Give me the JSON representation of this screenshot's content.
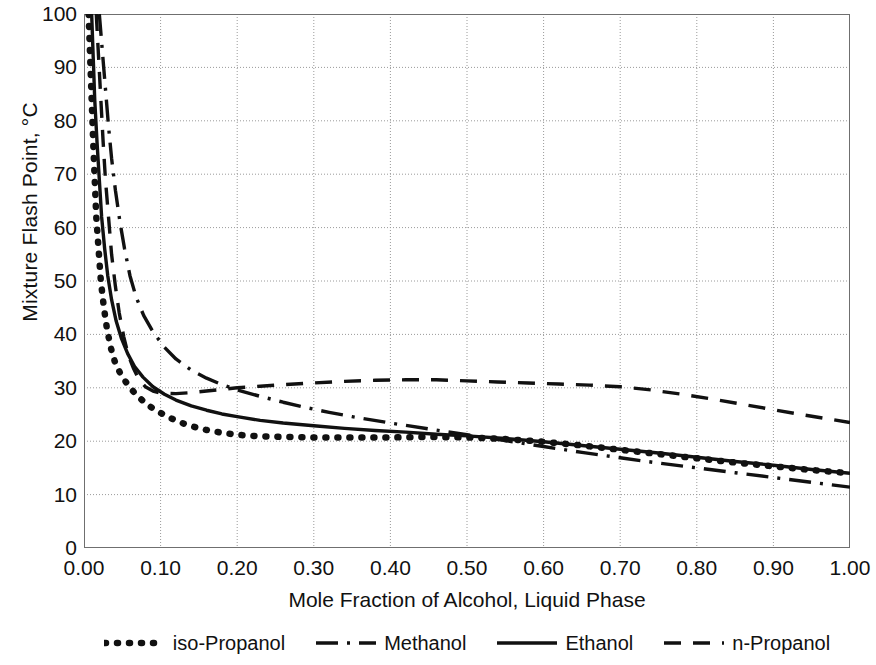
{
  "chart_data": {
    "type": "line",
    "title": "",
    "xlabel": "Mole Fraction of Alcohol, Liquid Phase",
    "ylabel": "Mixture Flash Point, °C",
    "xlim": [
      0.0,
      1.0
    ],
    "ylim": [
      0,
      100
    ],
    "xticks": [
      "0.00",
      "0.10",
      "0.20",
      "0.30",
      "0.40",
      "0.50",
      "0.60",
      "0.70",
      "0.80",
      "0.90",
      "1.00"
    ],
    "xtick_values": [
      0.0,
      0.1,
      0.2,
      0.3,
      0.4,
      0.5,
      0.6,
      0.7,
      0.8,
      0.9,
      1.0
    ],
    "yticks": [
      "0",
      "10",
      "20",
      "30",
      "40",
      "50",
      "60",
      "70",
      "80",
      "90",
      "100"
    ],
    "ytick_values": [
      0,
      10,
      20,
      30,
      40,
      50,
      60,
      70,
      80,
      90,
      100
    ],
    "grid": true,
    "legend_position": "below",
    "series": [
      {
        "name": "iso-Propanol",
        "style": "dotted",
        "color": "#111111",
        "points": [
          [
            0.006,
            100
          ],
          [
            0.008,
            92
          ],
          [
            0.01,
            84
          ],
          [
            0.012,
            76
          ],
          [
            0.014,
            69
          ],
          [
            0.016,
            62
          ],
          [
            0.019,
            56
          ],
          [
            0.022,
            50
          ],
          [
            0.026,
            45
          ],
          [
            0.03,
            41
          ],
          [
            0.035,
            37.5
          ],
          [
            0.04,
            35
          ],
          [
            0.048,
            32.5
          ],
          [
            0.056,
            30.8
          ],
          [
            0.065,
            29.2
          ],
          [
            0.075,
            27.8
          ],
          [
            0.085,
            26.6
          ],
          [
            0.1,
            25.3
          ],
          [
            0.115,
            24.2
          ],
          [
            0.13,
            23.3
          ],
          [
            0.15,
            22.4
          ],
          [
            0.17,
            21.8
          ],
          [
            0.2,
            21.2
          ],
          [
            0.23,
            20.9
          ],
          [
            0.26,
            20.8
          ],
          [
            0.3,
            20.7
          ],
          [
            0.35,
            20.7
          ],
          [
            0.4,
            20.7
          ],
          [
            0.45,
            20.8
          ],
          [
            0.5,
            20.7
          ],
          [
            0.55,
            20.4
          ],
          [
            0.6,
            19.9
          ],
          [
            0.65,
            19.2
          ],
          [
            0.7,
            18.4
          ],
          [
            0.75,
            17.6
          ],
          [
            0.8,
            16.8
          ],
          [
            0.85,
            16.0
          ],
          [
            0.9,
            15.3
          ],
          [
            0.95,
            14.6
          ],
          [
            1.0,
            14.0
          ]
        ]
      },
      {
        "name": "Methanol",
        "style": "dashdot",
        "color": "#111111",
        "points": [
          [
            0.02,
            100
          ],
          [
            0.024,
            93
          ],
          [
            0.028,
            86
          ],
          [
            0.032,
            79
          ],
          [
            0.036,
            73
          ],
          [
            0.041,
            67
          ],
          [
            0.047,
            61
          ],
          [
            0.053,
            56
          ],
          [
            0.06,
            51
          ],
          [
            0.068,
            47
          ],
          [
            0.078,
            43.5
          ],
          [
            0.09,
            40.5
          ],
          [
            0.105,
            37.6
          ],
          [
            0.12,
            35.4
          ],
          [
            0.14,
            33.3
          ],
          [
            0.16,
            31.8
          ],
          [
            0.18,
            30.6
          ],
          [
            0.2,
            29.6
          ],
          [
            0.23,
            28.4
          ],
          [
            0.26,
            27.3
          ],
          [
            0.29,
            26.3
          ],
          [
            0.32,
            25.4
          ],
          [
            0.35,
            24.6
          ],
          [
            0.4,
            23.4
          ],
          [
            0.45,
            22.3
          ],
          [
            0.5,
            21.2
          ],
          [
            0.55,
            20.1
          ],
          [
            0.6,
            19.0
          ],
          [
            0.65,
            17.9
          ],
          [
            0.7,
            16.9
          ],
          [
            0.75,
            15.9
          ],
          [
            0.8,
            15.0
          ],
          [
            0.85,
            14.1
          ],
          [
            0.9,
            13.2
          ],
          [
            0.95,
            12.3
          ],
          [
            1.0,
            11.4
          ]
        ]
      },
      {
        "name": "Ethanol",
        "style": "solid",
        "color": "#111111",
        "points": [
          [
            0.01,
            100
          ],
          [
            0.012,
            92
          ],
          [
            0.014,
            84
          ],
          [
            0.017,
            76
          ],
          [
            0.02,
            69
          ],
          [
            0.023,
            62
          ],
          [
            0.027,
            56
          ],
          [
            0.031,
            51
          ],
          [
            0.036,
            46.5
          ],
          [
            0.042,
            42.5
          ],
          [
            0.049,
            39.2
          ],
          [
            0.057,
            36.4
          ],
          [
            0.066,
            34.0
          ],
          [
            0.077,
            32.0
          ],
          [
            0.09,
            30.2
          ],
          [
            0.105,
            28.8
          ],
          [
            0.12,
            27.7
          ],
          [
            0.14,
            26.6
          ],
          [
            0.16,
            25.8
          ],
          [
            0.18,
            25.1
          ],
          [
            0.2,
            24.6
          ],
          [
            0.23,
            23.9
          ],
          [
            0.26,
            23.4
          ],
          [
            0.3,
            22.9
          ],
          [
            0.34,
            22.4
          ],
          [
            0.38,
            22.0
          ],
          [
            0.42,
            21.7
          ],
          [
            0.46,
            21.3
          ],
          [
            0.5,
            21.0
          ],
          [
            0.55,
            20.5
          ],
          [
            0.6,
            19.9
          ],
          [
            0.65,
            19.2
          ],
          [
            0.7,
            18.5
          ],
          [
            0.75,
            17.8
          ],
          [
            0.8,
            17.0
          ],
          [
            0.85,
            16.2
          ],
          [
            0.9,
            15.5
          ],
          [
            0.95,
            14.7
          ],
          [
            1.0,
            14.0
          ]
        ]
      },
      {
        "name": "n-Propanol",
        "style": "dashed",
        "color": "#111111",
        "points": [
          [
            0.016,
            100
          ],
          [
            0.019,
            92
          ],
          [
            0.022,
            84
          ],
          [
            0.025,
            76
          ],
          [
            0.028,
            69
          ],
          [
            0.032,
            62
          ],
          [
            0.036,
            55
          ],
          [
            0.041,
            49
          ],
          [
            0.046,
            44
          ],
          [
            0.052,
            39.5
          ],
          [
            0.058,
            36
          ],
          [
            0.065,
            33.5
          ],
          [
            0.072,
            31.5
          ],
          [
            0.08,
            30.2
          ],
          [
            0.09,
            29.4
          ],
          [
            0.1,
            29.0
          ],
          [
            0.12,
            28.9
          ],
          [
            0.14,
            29.1
          ],
          [
            0.16,
            29.4
          ],
          [
            0.18,
            29.7
          ],
          [
            0.2,
            30.0
          ],
          [
            0.23,
            30.3
          ],
          [
            0.26,
            30.6
          ],
          [
            0.3,
            30.9
          ],
          [
            0.34,
            31.2
          ],
          [
            0.38,
            31.4
          ],
          [
            0.42,
            31.5
          ],
          [
            0.46,
            31.5
          ],
          [
            0.5,
            31.3
          ],
          [
            0.54,
            31.1
          ],
          [
            0.58,
            30.9
          ],
          [
            0.62,
            30.7
          ],
          [
            0.66,
            30.5
          ],
          [
            0.7,
            30.2
          ],
          [
            0.74,
            29.6
          ],
          [
            0.78,
            28.8
          ],
          [
            0.82,
            27.9
          ],
          [
            0.86,
            26.9
          ],
          [
            0.9,
            25.9
          ],
          [
            0.94,
            24.9
          ],
          [
            1.0,
            23.5
          ]
        ]
      }
    ]
  },
  "legend": {
    "items": [
      {
        "label": "iso-Propanol",
        "style": "dotted"
      },
      {
        "label": "Methanol",
        "style": "dashdot"
      },
      {
        "label": "Ethanol",
        "style": "solid"
      },
      {
        "label": "n-Propanol",
        "style": "dashed"
      }
    ]
  }
}
